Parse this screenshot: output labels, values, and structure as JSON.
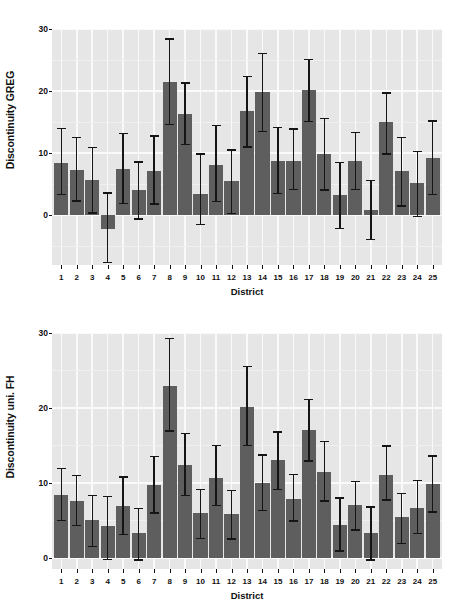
{
  "figure": {
    "background": "#ffffff",
    "bar_color": "#5e5e5e",
    "error_color": "#151515",
    "panel_background": "#e6e6e6",
    "grid_color": "#fafafa"
  },
  "chart_data": [
    {
      "type": "bar",
      "title": "",
      "xlabel": "District",
      "ylabel": "Discontinuity GREG",
      "ylim": [
        -8,
        30
      ],
      "yticks": [
        0,
        10,
        20,
        30
      ],
      "xlim": [
        0.4,
        25.6
      ],
      "grid": true,
      "legend": "none",
      "categories": [
        "1",
        "2",
        "3",
        "4",
        "5",
        "6",
        "7",
        "8",
        "9",
        "10",
        "11",
        "12",
        "13",
        "14",
        "15",
        "16",
        "17",
        "18",
        "19",
        "20",
        "21",
        "22",
        "23",
        "24",
        "25"
      ],
      "values": [
        8.4,
        7.3,
        5.7,
        -2.2,
        7.4,
        4.0,
        7.1,
        21.4,
        16.3,
        3.5,
        8.1,
        5.6,
        16.8,
        19.9,
        8.7,
        8.8,
        20.1,
        9.8,
        3.3,
        8.7,
        0.8,
        15.0,
        7.1,
        5.2,
        9.3
      ],
      "error_low": [
        3.4,
        2.3,
        0.4,
        -7.6,
        1.9,
        -0.6,
        1.8,
        14.6,
        11.4,
        -1.5,
        2.2,
        0.3,
        11.0,
        13.5,
        3.5,
        4.2,
        15.1,
        4.1,
        -2.1,
        4.2,
        -3.9,
        9.9,
        1.5,
        -0.2,
        3.4
      ],
      "error_high": [
        14.0,
        12.5,
        10.9,
        3.6,
        13.2,
        8.6,
        12.8,
        28.4,
        21.3,
        9.9,
        14.5,
        10.5,
        22.4,
        26.1,
        14.1,
        13.9,
        25.1,
        15.6,
        8.5,
        13.3,
        5.6,
        19.7,
        12.5,
        10.3,
        15.2
      ]
    },
    {
      "type": "bar",
      "title": "",
      "xlabel": "District",
      "ylabel": "Discontinuity uni. FH",
      "ylim": [
        -1.5,
        30
      ],
      "yticks": [
        0,
        10,
        20,
        30
      ],
      "xlim": [
        0.4,
        25.6
      ],
      "grid": true,
      "legend": "none",
      "categories": [
        "1",
        "2",
        "3",
        "4",
        "5",
        "6",
        "7",
        "8",
        "9",
        "10",
        "11",
        "12",
        "13",
        "14",
        "15",
        "16",
        "17",
        "18",
        "19",
        "20",
        "21",
        "22",
        "23",
        "24",
        "25"
      ],
      "values": [
        8.4,
        7.6,
        5.1,
        4.2,
        6.9,
        3.3,
        9.7,
        22.9,
        12.4,
        6.0,
        10.7,
        5.9,
        20.1,
        10.0,
        13.1,
        7.9,
        17.0,
        11.5,
        4.4,
        7.0,
        3.3,
        11.1,
        5.5,
        6.7,
        9.8
      ],
      "error_low": [
        5.0,
        4.3,
        1.5,
        -0.2,
        3.1,
        -0.3,
        6.0,
        16.9,
        8.3,
        2.6,
        7.0,
        2.5,
        15.0,
        6.3,
        9.1,
        4.9,
        12.9,
        7.6,
        0.9,
        3.7,
        -0.3,
        7.7,
        1.9,
        3.2,
        6.1
      ],
      "error_high": [
        11.9,
        11.0,
        8.3,
        8.2,
        10.8,
        6.6,
        13.5,
        29.3,
        16.6,
        9.1,
        15.0,
        9.0,
        25.5,
        13.7,
        16.8,
        11.1,
        21.1,
        15.5,
        8.0,
        10.2,
        6.8,
        14.9,
        8.6,
        10.3,
        13.6
      ]
    }
  ]
}
